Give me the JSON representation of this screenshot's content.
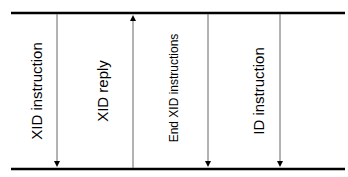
{
  "diagram": {
    "type": "sequence",
    "top_line": {
      "y": 13,
      "x1": 11,
      "x2": 345
    },
    "bottom_line": {
      "y": 169,
      "x1": 11,
      "x2": 345
    },
    "line_color": "#000000",
    "arrow_color": "#555555",
    "messages": [
      {
        "label": "XID instruction",
        "x": 57,
        "label_x": 38,
        "direction": "down",
        "font_size": 15
      },
      {
        "label": "XID reply",
        "x": 133,
        "label_x": 104,
        "direction": "up",
        "font_size": 15
      },
      {
        "label": "End XID instructions",
        "x": 208,
        "label_x": 175,
        "direction": "down",
        "font_size": 12
      },
      {
        "label": "ID instruction",
        "x": 280,
        "label_x": 260,
        "direction": "down",
        "font_size": 15
      }
    ]
  }
}
